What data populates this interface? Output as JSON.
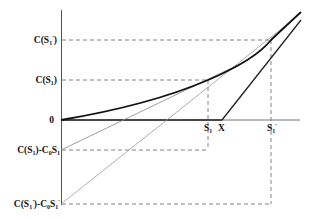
{
  "diagram": {
    "y_labels": {
      "c_s1_prime": {
        "main": "C(S",
        "sub": "1",
        "prime": "'",
        "close": ")"
      },
      "c_s1": {
        "main": "C(S",
        "sub": "1",
        "close": ")"
      },
      "zero": "0",
      "hedge_s1": {
        "text": "C(S₁)-C₀S₁"
      },
      "hedge_s1_prime": {
        "text": "C(S'₁)-C₀S'₁"
      }
    },
    "x_labels": {
      "s1": "S₁",
      "x": "X",
      "s1_prime": "S'₁"
    },
    "colors": {
      "curve": "#111111",
      "axis": "#555555",
      "dashed": "#666666",
      "tangent": "#888888",
      "payoff": "#222222"
    },
    "elements": [
      "option-value-curve",
      "intrinsic-payoff-line",
      "tangent-at-s1",
      "tangent-at-s1-prime",
      "guide-lines"
    ]
  }
}
